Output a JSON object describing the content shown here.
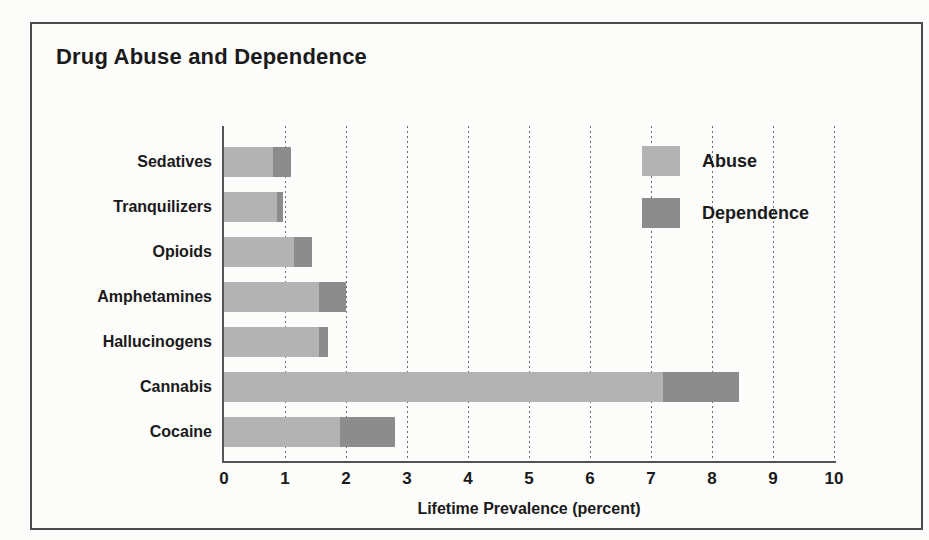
{
  "figure": {
    "frame_border_color": "#4a4a4a",
    "background_color": "#fcfcfa"
  },
  "chart_data": {
    "type": "bar",
    "orientation": "horizontal",
    "stacked": true,
    "title": "Drug Abuse and Dependence",
    "xlabel": "Lifetime Prevalence (percent)",
    "ylabel": "",
    "xlim": [
      0,
      10
    ],
    "xticks": [
      0,
      1,
      2,
      3,
      4,
      5,
      6,
      7,
      8,
      9,
      10
    ],
    "xtick_labels": [
      "0",
      "1",
      "2",
      "3",
      "4",
      "5",
      "6",
      "7",
      "8",
      "9",
      "10"
    ],
    "grid": "vertical-dotted",
    "legend_position": "upper-right-inside",
    "categories": [
      "Sedatives",
      "Tranquilizers",
      "Opioids",
      "Amphetamines",
      "Hallucinogens",
      "Cannabis",
      "Cocaine"
    ],
    "series": [
      {
        "name": "Abuse",
        "color": "#b3b3b3",
        "values": [
          0.8,
          0.87,
          1.15,
          1.55,
          1.55,
          7.2,
          1.9
        ]
      },
      {
        "name": "Dependence",
        "color": "#8c8c8c",
        "values": [
          0.3,
          0.1,
          0.3,
          0.45,
          0.15,
          1.25,
          0.9
        ]
      }
    ],
    "totals": [
      1.1,
      0.97,
      1.45,
      2.0,
      1.7,
      8.45,
      2.8
    ]
  },
  "legend": {
    "items": [
      {
        "label": "Abuse",
        "color": "#b3b3b3"
      },
      {
        "label": "Dependence",
        "color": "#8c8c8c"
      }
    ]
  }
}
